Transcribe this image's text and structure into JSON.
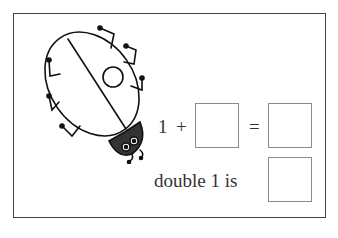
{
  "worksheet": {
    "illustration": "ladybug",
    "equation": {
      "left_operand": "1",
      "plus": "+",
      "equals": "=",
      "answer_box_1": "",
      "answer_box_2": ""
    },
    "double_prompt": {
      "text": "double 1 is",
      "answer_box": ""
    }
  }
}
